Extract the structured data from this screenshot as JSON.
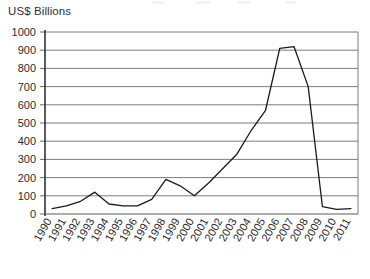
{
  "chart_data": {
    "type": "line",
    "title": "",
    "subtitle": "",
    "ylabel": "US$ Billions",
    "xlabel": "",
    "ylim": [
      0,
      1000
    ],
    "ytick_step": 100,
    "yticks": [
      0,
      100,
      200,
      300,
      400,
      500,
      600,
      700,
      800,
      900,
      1000
    ],
    "ytick_labels": [
      "0",
      "100",
      "200",
      "300",
      "400",
      "500",
      "600",
      "700",
      "800",
      "900",
      "1000"
    ],
    "grid": true,
    "grid_axis": "y",
    "legend": false,
    "legend_position": "none",
    "categories": [
      1990,
      1991,
      1992,
      1993,
      1994,
      1995,
      1996,
      1997,
      1998,
      1999,
      2000,
      2001,
      2002,
      2003,
      2004,
      2005,
      2006,
      2007,
      2008,
      2009,
      2010,
      2011
    ],
    "xtick_labels": [
      "1990",
      "1991",
      "1992",
      "1993",
      "1994",
      "1995",
      "1996",
      "1997",
      "1998",
      "1999",
      "2000",
      "2001",
      "2002",
      "2003",
      "2004",
      "2005",
      "2006",
      "2007",
      "2008",
      "2009",
      "2010",
      "2011"
    ],
    "xtick_rotation": -60,
    "series": [
      {
        "name": "US$ Billions",
        "color": "#1a1a1a",
        "values": [
          30,
          45,
          70,
          120,
          55,
          45,
          45,
          80,
          190,
          155,
          100,
          170,
          250,
          330,
          460,
          570,
          910,
          920,
          700,
          40,
          25,
          30
        ]
      }
    ]
  },
  "axis": {
    "y_title": "US$ Billions"
  },
  "colors": {
    "line": "#1a1a1a",
    "grid": "#6e6e6e",
    "axis": "#333333",
    "text": "#2b2b2b",
    "background": "#ffffff"
  }
}
